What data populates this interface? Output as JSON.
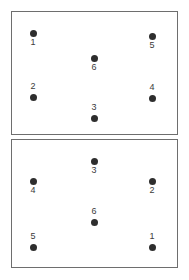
{
  "figure": {
    "background_color": "#ffffff",
    "frame_color": "#6e6e6e",
    "dot_color": "#2e2e2e",
    "label_color": "#3b3b3b",
    "panel_count": 2
  },
  "panels": [
    {
      "name": "top-panel",
      "points": [
        {
          "label": "1",
          "x": 33,
          "y": 33,
          "label_position": "below"
        },
        {
          "label": "5",
          "x": 152,
          "y": 36,
          "label_position": "below"
        },
        {
          "label": "6",
          "x": 94,
          "y": 58,
          "label_position": "below"
        },
        {
          "label": "2",
          "x": 33,
          "y": 97,
          "label_position": "above"
        },
        {
          "label": "4",
          "x": 152,
          "y": 98,
          "label_position": "above"
        },
        {
          "label": "3",
          "x": 94,
          "y": 118,
          "label_position": "above"
        }
      ]
    },
    {
      "name": "bottom-panel",
      "points": [
        {
          "label": "3",
          "x": 94,
          "y": 161,
          "label_position": "below"
        },
        {
          "label": "4",
          "x": 33,
          "y": 181,
          "label_position": "below"
        },
        {
          "label": "2",
          "x": 152,
          "y": 181,
          "label_position": "below"
        },
        {
          "label": "6",
          "x": 94,
          "y": 222,
          "label_position": "above"
        },
        {
          "label": "5",
          "x": 33,
          "y": 247,
          "label_position": "above"
        },
        {
          "label": "1",
          "x": 152,
          "y": 247,
          "label_position": "above"
        }
      ]
    }
  ],
  "chart_data": {
    "type": "scatter",
    "title": "",
    "xlabel": "",
    "ylabel": "",
    "grid": false,
    "legend": "none",
    "subplots": [
      {
        "name": "top-panel",
        "point_labels": [
          "1",
          "5",
          "6",
          "2",
          "4",
          "3"
        ],
        "x": [
          33,
          152,
          94,
          33,
          152,
          94
        ],
        "y": [
          33,
          36,
          58,
          97,
          98,
          118
        ]
      },
      {
        "name": "bottom-panel",
        "point_labels": [
          "3",
          "4",
          "2",
          "6",
          "5",
          "1"
        ],
        "x": [
          94,
          33,
          152,
          94,
          33,
          152
        ],
        "y": [
          161,
          181,
          181,
          222,
          247,
          247
        ]
      }
    ]
  }
}
